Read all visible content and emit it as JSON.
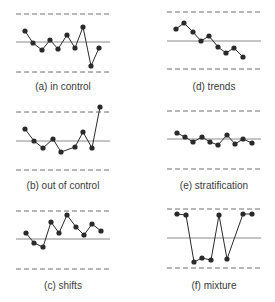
{
  "figure": {
    "colors": {
      "ink": "#2a2a2a",
      "center_line": "#8a8a8a",
      "limit_line": "#707070",
      "text": "#3a3a3a"
    }
  },
  "chart_data": [
    {
      "type": "line",
      "id": "a",
      "title": "(a) in control",
      "xlabel": "",
      "ylabel": "",
      "grid": false,
      "reference_lines": {
        "upper_control_limit": "dashed",
        "center_line": "solid",
        "lower_control_limit": "dashed"
      },
      "layout": {
        "x0": 16,
        "x1": 110,
        "ucl_y": 14,
        "cl_y": 42,
        "lcl_y": 72,
        "label_x": 63,
        "label_y": 81
      },
      "points_px": [
        [
          25,
          31
        ],
        [
          33,
          43
        ],
        [
          42,
          50
        ],
        [
          50,
          40
        ],
        [
          58,
          49
        ],
        [
          67,
          35
        ],
        [
          75,
          48
        ],
        [
          83,
          27
        ],
        [
          91,
          66
        ],
        [
          99,
          48
        ]
      ],
      "values": [
        0.37,
        -0.03,
        -0.27,
        0.07,
        -0.23,
        0.23,
        -0.2,
        0.5,
        -0.8,
        -0.2
      ]
    },
    {
      "type": "line",
      "id": "b",
      "title": "(b) out of control",
      "xlabel": "",
      "ylabel": "",
      "grid": false,
      "reference_lines": {
        "upper_control_limit": "dashed",
        "center_line": "solid",
        "lower_control_limit": "dashed"
      },
      "layout": {
        "x0": 16,
        "x1": 110,
        "ucl_y": 112,
        "cl_y": 141,
        "lcl_y": 170,
        "label_x": 63,
        "label_y": 180
      },
      "points_px": [
        [
          25,
          129
        ],
        [
          34,
          141
        ],
        [
          43,
          148
        ],
        [
          53,
          139
        ],
        [
          61,
          152
        ],
        [
          75,
          147
        ],
        [
          83,
          132
        ],
        [
          92,
          148
        ],
        [
          100,
          107
        ]
      ],
      "values": [
        0.41,
        0.0,
        -0.24,
        0.07,
        -0.38,
        -0.21,
        0.31,
        -0.24,
        1.17
      ]
    },
    {
      "type": "line",
      "id": "c",
      "title": "(c) shifts",
      "xlabel": "",
      "ylabel": "",
      "grid": false,
      "reference_lines": {
        "upper_control_limit": "dashed",
        "center_line": "solid",
        "lower_control_limit": "dashed"
      },
      "layout": {
        "x0": 16,
        "x1": 110,
        "ucl_y": 211,
        "cl_y": 239,
        "lcl_y": 269,
        "label_x": 63,
        "label_y": 280
      },
      "points_px": [
        [
          26,
          233
        ],
        [
          34,
          243
        ],
        [
          43,
          247
        ],
        [
          51,
          222
        ],
        [
          59,
          233
        ],
        [
          67,
          215
        ],
        [
          76,
          227
        ],
        [
          84,
          235
        ],
        [
          92,
          224
        ],
        [
          101,
          231
        ]
      ],
      "values": [
        0.21,
        -0.14,
        -0.29,
        0.61,
        0.21,
        0.86,
        0.43,
        0.14,
        0.54,
        0.29
      ]
    },
    {
      "type": "line",
      "id": "d",
      "title": "(d) trends",
      "xlabel": "",
      "ylabel": "",
      "grid": false,
      "reference_lines": {
        "upper_control_limit": "dashed",
        "center_line": "solid",
        "lower_control_limit": "dashed"
      },
      "layout": {
        "x0": 167,
        "x1": 261,
        "ucl_y": 12,
        "cl_y": 41,
        "lcl_y": 69,
        "label_x": 214,
        "label_y": 81
      },
      "points_px": [
        [
          176,
          29
        ],
        [
          184,
          23
        ],
        [
          193,
          32
        ],
        [
          201,
          41
        ],
        [
          209,
          36
        ],
        [
          218,
          47
        ],
        [
          226,
          53
        ],
        [
          234,
          48
        ],
        [
          243,
          57
        ]
      ],
      "values": [
        0.41,
        0.62,
        0.31,
        0.0,
        0.17,
        -0.21,
        -0.43,
        -0.25,
        -0.57
      ]
    },
    {
      "type": "line",
      "id": "e",
      "title": "(e) stratification",
      "xlabel": "",
      "ylabel": "",
      "grid": false,
      "reference_lines": {
        "upper_control_limit": "dashed",
        "center_line": "solid",
        "lower_control_limit": "dashed"
      },
      "layout": {
        "x0": 167,
        "x1": 261,
        "ucl_y": 111,
        "cl_y": 139,
        "lcl_y": 169,
        "label_x": 214,
        "label_y": 180
      },
      "points_px": [
        [
          177,
          133
        ],
        [
          185,
          137
        ],
        [
          193,
          142
        ],
        [
          202,
          137
        ],
        [
          210,
          142
        ],
        [
          218,
          145
        ],
        [
          227,
          135
        ],
        [
          235,
          144
        ],
        [
          243,
          139
        ],
        [
          252,
          143
        ]
      ],
      "values": [
        0.21,
        0.07,
        -0.1,
        0.07,
        -0.1,
        -0.21,
        0.14,
        -0.17,
        0.0,
        -0.14
      ]
    },
    {
      "type": "line",
      "id": "f",
      "title": "(f) mixture",
      "xlabel": "",
      "ylabel": "",
      "grid": false,
      "reference_lines": {
        "upper_control_limit": "dashed",
        "center_line": "solid",
        "lower_control_limit": "dashed"
      },
      "layout": {
        "x0": 167,
        "x1": 261,
        "ucl_y": 209,
        "cl_y": 238,
        "lcl_y": 268,
        "label_x": 214,
        "label_y": 280
      },
      "points_px": [
        [
          177,
          214
        ],
        [
          186,
          215
        ],
        [
          194,
          262
        ],
        [
          202,
          258
        ],
        [
          211,
          260
        ],
        [
          219,
          215
        ],
        [
          227,
          259
        ],
        [
          243,
          214
        ],
        [
          252,
          214
        ]
      ],
      "values": [
        0.83,
        0.79,
        -0.8,
        -0.67,
        -0.73,
        0.79,
        -0.7,
        0.83,
        0.83
      ]
    }
  ]
}
